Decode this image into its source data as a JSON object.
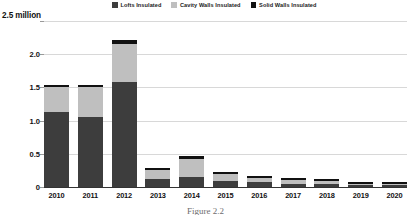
{
  "chart_data": {
    "type": "bar",
    "subtype": "stacked-vertical",
    "title": "",
    "xlabel": "",
    "ylabel": "2.5 million",
    "ylim": [
      0,
      2.5
    ],
    "yticks": [
      "0",
      "0.5",
      "1.0",
      "1.5",
      "2.0",
      "2.5 million"
    ],
    "ytick_values": [
      0,
      0.5,
      1.0,
      1.5,
      2.0,
      2.5
    ],
    "grid": true,
    "legend_position": "top-center",
    "categories": [
      "2010",
      "2011",
      "2012",
      "2013",
      "2014",
      "2015",
      "2016",
      "2017",
      "2018",
      "2019",
      "2020"
    ],
    "series": [
      {
        "name": "Lofts Insulated",
        "color": "#3d3d3d",
        "values": [
          1.13,
          1.05,
          1.58,
          0.12,
          0.15,
          0.09,
          0.07,
          0.05,
          0.05,
          0.03,
          0.03
        ]
      },
      {
        "name": "Cavity Walls Insulated",
        "color": "#bfbfbf",
        "values": [
          0.37,
          0.45,
          0.58,
          0.13,
          0.27,
          0.1,
          0.06,
          0.05,
          0.04,
          0.02,
          0.02
        ]
      },
      {
        "name": "Solid Walls Insulated",
        "color": "#111111",
        "values": [
          0.04,
          0.04,
          0.05,
          0.03,
          0.04,
          0.03,
          0.03,
          0.03,
          0.03,
          0.02,
          0.02
        ]
      }
    ]
  },
  "legend": {
    "items": [
      {
        "label": "Lofts Insulated",
        "color": "#3d3d3d"
      },
      {
        "label": "Cavity Walls Insulated",
        "color": "#bfbfbf"
      },
      {
        "label": "Solid Walls Insulated",
        "color": "#111111"
      }
    ]
  },
  "caption": "Figure 2.2"
}
